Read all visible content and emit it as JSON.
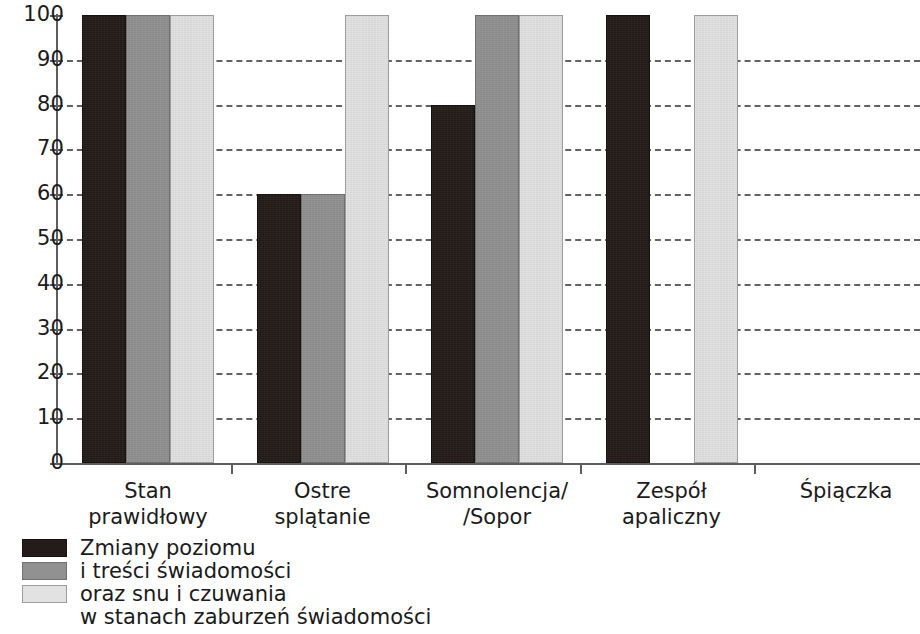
{
  "chart_data": {
    "type": "bar",
    "title": "",
    "subtitle": "",
    "xlabel": "",
    "ylabel": "",
    "ylim": [
      0,
      100
    ],
    "yticks": [
      0,
      10,
      20,
      30,
      40,
      50,
      60,
      70,
      80,
      90,
      100
    ],
    "grid": "horizontal-dashed",
    "legend_position": "bottom-left",
    "categories": [
      "Stan prawidłowy",
      "Ostre splątanie",
      "Somnolencja//Sopor",
      "Zespół apaliczny",
      "Śpiączka"
    ],
    "category_lines": [
      [
        "Stan",
        "prawidłowy"
      ],
      [
        "Ostre",
        "splątanie"
      ],
      [
        "Somnolencja/",
        "/Sopor"
      ],
      [
        "Zespół",
        "apaliczny"
      ],
      [
        "Śpiączka",
        ""
      ]
    ],
    "series": [
      {
        "name": "Zmiany poziomu",
        "color": "#231c18",
        "values": [
          100,
          60,
          80,
          100,
          0
        ]
      },
      {
        "name": "i treści świadomości",
        "color": "#919191",
        "values": [
          100,
          60,
          100,
          0,
          0
        ]
      },
      {
        "name": "oraz snu i czuwania",
        "color": "#e2e2e2",
        "values": [
          100,
          100,
          100,
          100,
          0
        ]
      }
    ],
    "legend_caption_lines": [
      "Zmiany poziomu",
      "i treści świadomości",
      "oraz snu i czuwania",
      "w stanach zaburzeń świadomości"
    ],
    "axis_color": "#5d5d61",
    "grid_color": "#55555a",
    "text_color": "#1b1b1b",
    "background": "#ffffff"
  }
}
